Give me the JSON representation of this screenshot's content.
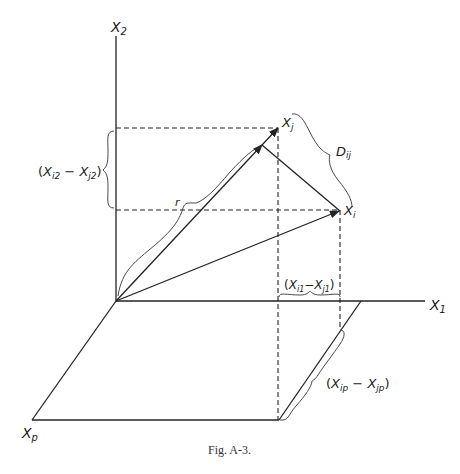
{
  "figure": {
    "caption": "Fig. A-3.",
    "axes": {
      "x2": {
        "name": "X",
        "sub": "2"
      },
      "x1": {
        "name": "X",
        "sub": "1"
      },
      "xp": {
        "name": "X",
        "sub": "p"
      }
    },
    "points": {
      "xj": {
        "name": "X",
        "sub": "j"
      },
      "xi": {
        "name": "X",
        "sub": "i"
      }
    },
    "labels": {
      "r": "r",
      "dij": {
        "name": "D",
        "sub": "ij"
      },
      "diff2": {
        "open": "(",
        "a": "X",
        "a_sub": "i2",
        "minus": " − ",
        "b": "X",
        "b_sub": "j2",
        "close": ")"
      },
      "diff1": {
        "open": "(",
        "a": "X",
        "a_sub": "i1",
        "minus": "−",
        "b": "X",
        "b_sub": "j1",
        "close": ")"
      },
      "diffp": {
        "open": "(",
        "a": "X",
        "a_sub": "ip",
        "minus": " − ",
        "b": "X",
        "b_sub": "jp",
        "close": ")"
      }
    },
    "colors": {
      "ink": "#222222",
      "background": "#ffffff"
    }
  }
}
